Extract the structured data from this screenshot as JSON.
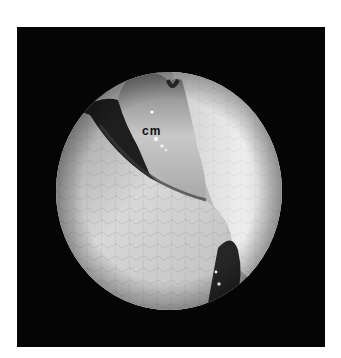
{
  "figure": {
    "type": "endoscopic photograph (grayscale)",
    "background_color": "#ffffff",
    "frame_color": "#050505",
    "view": {
      "shape": "circle",
      "center": [
        169,
        191
      ],
      "radius_x": 113,
      "radius_y": 119
    },
    "annotations": [
      {
        "text": "cm",
        "x": 142,
        "y": 124,
        "color": "#111111"
      }
    ]
  }
}
